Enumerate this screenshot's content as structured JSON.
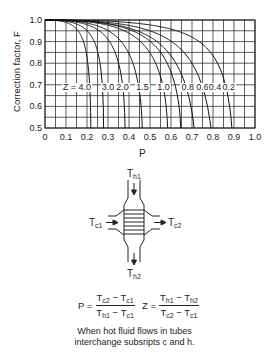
{
  "chart_data": {
    "type": "line",
    "title": "",
    "xlabel": "P",
    "ylabel": "Correction factor, F",
    "xlim": [
      0,
      1.0
    ],
    "ylim": [
      0.5,
      1.0
    ],
    "grid": true,
    "grid_step_x": 0.05,
    "grid_step_y": 0.05,
    "x_ticks": [
      "0",
      "0.1",
      "0.2",
      "0.3",
      "0.4",
      "0.5",
      "0.6",
      "0.7",
      "0.8",
      "0.9",
      "1.0"
    ],
    "y_ticks": [
      "1.0",
      "0.9",
      "0.8",
      "0.7",
      "0.6",
      "0.5"
    ],
    "series": [
      {
        "name": "Z = 4.0",
        "label": "Z = 4.0",
        "z": 4.0,
        "p_at_F05": 0.24
      },
      {
        "name": "3.0",
        "label": "3.0",
        "z": 3.0,
        "p_at_F05": 0.31
      },
      {
        "name": "2.0",
        "label": "2.0",
        "z": 2.0,
        "p_at_F05": 0.41
      },
      {
        "name": "1.5",
        "label": "1.5",
        "z": 1.5,
        "p_at_F05": 0.48
      },
      {
        "name": "1.0",
        "label": "1.0",
        "z": 1.0,
        "p_at_F05": 0.59
      },
      {
        "name": "0.8",
        "label": "0.8",
        "z": 0.8,
        "p_at_F05": 0.65
      },
      {
        "name": "0.6",
        "label": "0.6",
        "z": 0.6,
        "p_at_F05": 0.71
      },
      {
        "name": "0.4",
        "label": "0.4",
        "z": 0.4,
        "p_at_F05": 0.79
      },
      {
        "name": "0.2",
        "label": "0.2",
        "z": 0.2,
        "p_at_F05": 0.89
      }
    ],
    "annotation_row_F": 0.69
  },
  "diagram": {
    "th1": {
      "base": "T",
      "sub": "h1"
    },
    "th2": {
      "base": "T",
      "sub": "h2"
    },
    "tc1": {
      "base": "T",
      "sub": "c1"
    },
    "tc2": {
      "base": "T",
      "sub": "c2"
    }
  },
  "equations": {
    "p_lhs": "P =",
    "p_num": {
      "a": "T",
      "a_sub": "c2",
      "op": " − ",
      "b": "T",
      "b_sub": "c1"
    },
    "p_den": {
      "a": "T",
      "a_sub": "h1",
      "op": " − ",
      "b": "T",
      "b_sub": "c1"
    },
    "z_lhs": "Z =",
    "z_num": {
      "a": "T",
      "a_sub": "h1",
      "op": " − ",
      "b": "T",
      "b_sub": "h2"
    },
    "z_den": {
      "a": "T",
      "a_sub": "c2",
      "op": " − ",
      "b": "T",
      "b_sub": "c1"
    }
  },
  "note": {
    "line1": "When hot fluid flows in tubes",
    "line2": "interchange subsripts c and h."
  }
}
